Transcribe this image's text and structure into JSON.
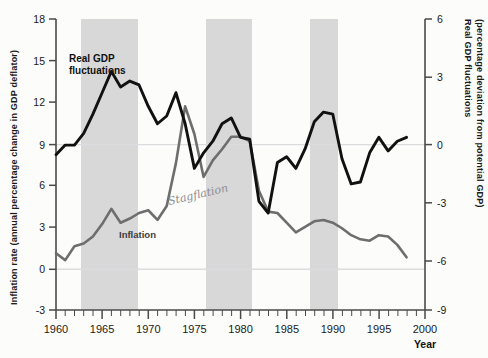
{
  "figure": {
    "background_color": "#fcfcfa",
    "band_color": "#d8d8d8",
    "gdp_line_color": "#111111",
    "inflation_line_color": "#6e6e6e",
    "gridline_color": "#d9d9dd"
  },
  "left_axis": {
    "title": "Inflation rate (annual percentage change in GDP deflator)",
    "ticks": [
      "18",
      "15",
      "12",
      "9",
      "6",
      "3",
      "0",
      "-3"
    ],
    "min": -3,
    "max": 18
  },
  "right_axis": {
    "title": "Real GDP fluctuations (percentage deviation from potential GDP)",
    "title_line1": "Real GDP fluctuations",
    "title_line2": "(percentage deviation from potential GDP)",
    "ticks": [
      "6",
      "3",
      "0",
      "-3",
      "-6",
      "-9"
    ],
    "min": -9,
    "max": 6
  },
  "x_axis": {
    "label": "Year",
    "ticks": [
      "1960",
      "1965",
      "1970",
      "1975",
      "1980",
      "1985",
      "1990",
      "1995",
      "2000"
    ],
    "min": 1960,
    "max": 2000,
    "minor_tick_interval": 1
  },
  "series_labels": {
    "gdp": "Real GDP fluctuations",
    "gdp_line1": "Real GDP",
    "gdp_line2": "fluctuations",
    "inflation": "Inflation"
  },
  "annotations": [
    {
      "text": "Stagflation",
      "x": 1975.6,
      "y_left": 4.0,
      "handwritten": true
    }
  ],
  "chart_data": {
    "type": "line",
    "title": "",
    "xlabel": "Year",
    "ylabel": "Inflation rate (annual percentage change in GDP deflator)",
    "y2label": "Real GDP fluctuations (percentage deviation from potential GDP)",
    "xlim": [
      1960,
      2000
    ],
    "ylim": [
      -3,
      18
    ],
    "y2lim": [
      -9,
      6
    ],
    "grid": false,
    "gridlines_y": [
      0,
      9.0
    ],
    "legend": "inline-labels",
    "shaded_bands": [
      {
        "label": "recession",
        "start": 1962.6,
        "end": 1968.3
      },
      {
        "label": "recession",
        "start": 1973.3,
        "end": 1977.9
      },
      {
        "label": "recession",
        "start": 1984.3,
        "end": 1986.8
      }
    ],
    "series": [
      {
        "name": "Real GDP fluctuations",
        "axis": "right",
        "color": "#111111",
        "x": [
          1960,
          1961,
          1962,
          1963,
          1964,
          1965,
          1966,
          1967,
          1968,
          1969,
          1970,
          1971,
          1972,
          1973,
          1974,
          1975,
          1976,
          1977,
          1978,
          1979,
          1980,
          1981,
          1982,
          1983,
          1984,
          1985,
          1986,
          1987,
          1988,
          1989,
          1990,
          1991,
          1992,
          1993,
          1994,
          1995,
          1996,
          1997,
          1998
        ],
        "values": [
          -1.0,
          -0.5,
          -0.5,
          0.1,
          1.1,
          2.2,
          3.3,
          2.5,
          2.8,
          2.6,
          1.5,
          0.6,
          1.0,
          2.2,
          0.6,
          -1.7,
          -0.9,
          -0.3,
          0.6,
          0.9,
          -0.1,
          -0.2,
          -3.4,
          -4.0,
          -1.4,
          -1.1,
          -1.7,
          -0.7,
          0.7,
          1.2,
          1.1,
          -1.2,
          -2.5,
          -2.4,
          -0.9,
          -0.1,
          -0.8,
          -0.3,
          -0.1
        ]
      },
      {
        "name": "Inflation",
        "axis": "left",
        "color": "#6e6e6e",
        "x": [
          1960,
          1961,
          1962,
          1963,
          1964,
          1965,
          1966,
          1967,
          1968,
          1969,
          1970,
          1971,
          1972,
          1973,
          1974,
          1975,
          1976,
          1977,
          1978,
          1979,
          1980,
          1981,
          1982,
          1983,
          1984,
          1985,
          1986,
          1987,
          1988,
          1989,
          1990,
          1991,
          1992,
          1993,
          1994,
          1995,
          1996,
          1997,
          1998
        ],
        "values": [
          1.1,
          0.6,
          1.6,
          1.8,
          2.3,
          3.2,
          4.3,
          3.3,
          3.6,
          4.0,
          4.2,
          3.5,
          4.5,
          7.6,
          11.7,
          9.7,
          6.6,
          7.8,
          8.6,
          9.5,
          9.5,
          9.2,
          5.6,
          4.1,
          4.0,
          3.3,
          2.6,
          3.0,
          3.4,
          3.5,
          3.3,
          2.9,
          2.4,
          2.1,
          2.0,
          2.4,
          2.3,
          1.7,
          0.8
        ]
      }
    ]
  }
}
